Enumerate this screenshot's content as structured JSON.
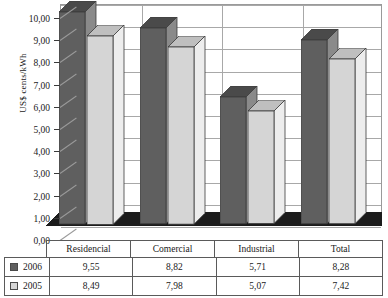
{
  "chart_data": {
    "type": "bar",
    "title": "",
    "xlabel": "",
    "ylabel": "US$ cents/kWh",
    "categories": [
      "Residencial",
      "Comercial",
      "Industrial",
      "Total"
    ],
    "series": [
      {
        "name": "2006",
        "values": [
          9.55,
          8.82,
          5.71,
          8.28
        ],
        "labels": [
          "9,55",
          "8,82",
          "5,71",
          "8,28"
        ],
        "color": "#5f5f5f"
      },
      {
        "name": "2005",
        "values": [
          8.49,
          7.98,
          5.07,
          7.42
        ],
        "labels": [
          "8,49",
          "7,98",
          "5,07",
          "7,42"
        ],
        "color": "#d5d5d5"
      }
    ],
    "ylim": [
      0,
      10
    ],
    "ytick_values": [
      0,
      1,
      2,
      3,
      4,
      5,
      6,
      7,
      8,
      9,
      10
    ],
    "ytick_labels": [
      "0,00",
      "1,00",
      "2,00",
      "3,00",
      "4,00",
      "5,00",
      "6,00",
      "7,00",
      "8,00",
      "9,00",
      "10,00"
    ],
    "grid": true,
    "grid_axis": "y",
    "legend_position": "table-left",
    "style": "3d-column",
    "decimal_separator": ","
  },
  "table": {
    "header_row": [
      "Residencial",
      "Comercial",
      "Industrial",
      "Total"
    ],
    "rows": [
      {
        "label": "2006",
        "values": [
          "9,55",
          "8,82",
          "5,71",
          "8,28"
        ]
      },
      {
        "label": "2005",
        "values": [
          "8,49",
          "7,98",
          "5,07",
          "7,42"
        ]
      }
    ]
  }
}
